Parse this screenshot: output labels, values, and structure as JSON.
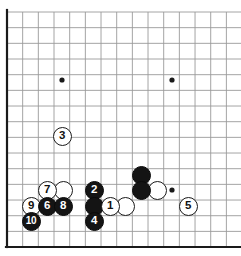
{
  "diagram": {
    "board_style": {
      "line_color": "#9a9a9a",
      "edge_color": "#1a1a1a",
      "background_color": "#ffffff",
      "black_stone_color": "#141414",
      "white_stone_color": "#ffffff",
      "star_point_color": "#1a1a1a"
    },
    "geometry": {
      "origin_x": 7,
      "origin_y": 12,
      "spacing": 15.67,
      "cols_visible": 15,
      "rows_visible": 15,
      "stone_diameter": 19,
      "edge_line_width": 2.2,
      "grid_line_width": 0.9
    },
    "star_points": [
      {
        "name": "star-upper-left",
        "x": 62,
        "y": 80
      },
      {
        "name": "star-upper-right",
        "x": 172,
        "y": 80
      },
      {
        "name": "star-lower-right",
        "x": 172,
        "y": 190
      }
    ],
    "edges": {
      "left_border_x": 7,
      "bottom_border_y": 247,
      "top_line_y": 12,
      "right_clipped": true
    },
    "stones": [
      {
        "label": "3",
        "color": "white",
        "x": 62,
        "y": 136,
        "z": 10
      },
      {
        "label": "7",
        "color": "white",
        "x": 47,
        "y": 190,
        "z": 11
      },
      {
        "label": "",
        "color": "white",
        "x": 63,
        "y": 190,
        "z": 10
      },
      {
        "label": "2",
        "color": "black",
        "x": 94,
        "y": 190,
        "z": 14
      },
      {
        "label": "",
        "color": "black",
        "x": 141,
        "y": 175,
        "z": 12
      },
      {
        "label": "",
        "color": "black",
        "x": 141,
        "y": 190,
        "z": 13
      },
      {
        "label": "",
        "color": "white",
        "x": 157,
        "y": 190,
        "z": 11
      },
      {
        "label": "9",
        "color": "white",
        "x": 31,
        "y": 206,
        "z": 15
      },
      {
        "label": "6",
        "color": "black",
        "x": 47,
        "y": 206,
        "z": 16
      },
      {
        "label": "8",
        "color": "black",
        "x": 63,
        "y": 206,
        "z": 17
      },
      {
        "label": "",
        "color": "black",
        "x": 94,
        "y": 206,
        "z": 15
      },
      {
        "label": "1",
        "color": "white",
        "x": 110,
        "y": 206,
        "z": 16
      },
      {
        "label": "",
        "color": "white",
        "x": 125,
        "y": 206,
        "z": 15
      },
      {
        "label": "5",
        "color": "white",
        "x": 188,
        "y": 206,
        "z": 12
      },
      {
        "label": "10",
        "color": "black",
        "x": 31,
        "y": 221,
        "z": 18
      },
      {
        "label": "4",
        "color": "black",
        "x": 94,
        "y": 221,
        "z": 17
      }
    ],
    "move_sequence": [
      {
        "move": 1,
        "color": "white"
      },
      {
        "move": 2,
        "color": "black"
      },
      {
        "move": 3,
        "color": "white"
      },
      {
        "move": 4,
        "color": "black"
      },
      {
        "move": 5,
        "color": "white"
      },
      {
        "move": 6,
        "color": "black"
      },
      {
        "move": 7,
        "color": "white"
      },
      {
        "move": 8,
        "color": "black"
      },
      {
        "move": 9,
        "color": "white"
      },
      {
        "move": 10,
        "color": "black"
      }
    ]
  }
}
